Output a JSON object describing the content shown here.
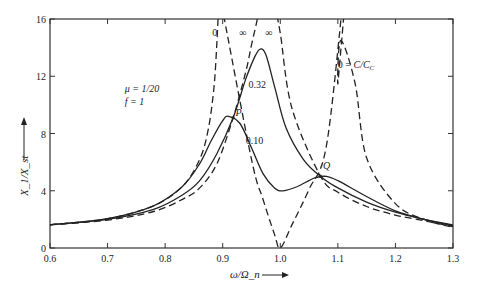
{
  "chart_data": {
    "type": "line",
    "title": "",
    "xlabel": "ω/Ω_n",
    "ylabel": "X_1/X_st",
    "xlim": [
      0.6,
      1.3
    ],
    "ylim": [
      0,
      16
    ],
    "xticks": [
      0.6,
      0.7,
      0.8,
      0.9,
      1.0,
      1.1,
      1.2,
      1.3
    ],
    "xtick_labels": [
      "0.6",
      "0.7",
      "0.8",
      "0.9",
      "1.0",
      "1.1",
      "1.2",
      "1.3"
    ],
    "yticks": [
      0,
      4,
      8,
      12,
      16
    ],
    "ytick_labels": [
      "0",
      "4",
      "8",
      "12",
      "16"
    ],
    "grid": false,
    "legend": null,
    "parameters": {
      "mu": "1/20",
      "f": "1"
    },
    "annotations": [
      {
        "text": "μ = 1/20",
        "x": 0.73,
        "y": 10.9
      },
      {
        "text": "f = 1",
        "x": 0.73,
        "y": 10.0
      },
      {
        "text": "0",
        "x": 0.882,
        "y": 14.8
      },
      {
        "text": "∞",
        "x": 0.935,
        "y": 14.8
      },
      {
        "text": "∞",
        "x": 0.98,
        "y": 14.8
      },
      {
        "text": "0.32",
        "x": 0.945,
        "y": 11.2
      },
      {
        "text": "P",
        "x": 0.922,
        "y": 9.2
      },
      {
        "text": "0.10",
        "x": 0.94,
        "y": 7.3
      },
      {
        "text": "Q",
        "x": 1.074,
        "y": 5.5
      },
      {
        "text": "0 = C/C_C",
        "x": 1.1,
        "y": 12.6
      }
    ],
    "points_of_interest": {
      "P": {
        "x": 0.918,
        "y": 9.1
      },
      "Q": {
        "x": 1.07,
        "y": 5.0
      }
    },
    "series": [
      {
        "name": "C/Cc = 0",
        "style": "dashed",
        "note": "undamped; two resonances near 0.895 and 1.117, zero at 1.0",
        "x": [
          0.6,
          0.7,
          0.78,
          0.83,
          0.86,
          0.875,
          0.885,
          0.89,
          0.95,
          0.97,
          0.99,
          1.0,
          1.02,
          1.05,
          1.08,
          1.1,
          1.105,
          1.13,
          1.15,
          1.2,
          1.25,
          1.3
        ],
        "y": [
          1.62,
          2.05,
          2.95,
          4.3,
          6.2,
          8.3,
          11.3,
          14.5,
          6.2,
          3.4,
          0.95,
          0.0,
          1.6,
          4.1,
          7.1,
          11.5,
          14.5,
          11.5,
          6.3,
          3.1,
          2.0,
          1.45
        ]
      },
      {
        "name": "C/Cc = 0.10",
        "style": "solid",
        "x": [
          0.6,
          0.7,
          0.78,
          0.83,
          0.86,
          0.88,
          0.9,
          0.91,
          0.93,
          0.95,
          0.97,
          0.99,
          1.005,
          1.03,
          1.06,
          1.08,
          1.1,
          1.15,
          1.2,
          1.25,
          1.3
        ],
        "y": [
          1.62,
          2.05,
          2.95,
          4.3,
          5.9,
          7.5,
          8.9,
          9.2,
          8.7,
          7.0,
          5.2,
          4.2,
          4.0,
          4.3,
          4.9,
          5.0,
          4.7,
          3.6,
          2.6,
          2.0,
          1.55
        ]
      },
      {
        "name": "C/Cc = 0.32",
        "style": "solid",
        "x": [
          0.6,
          0.7,
          0.78,
          0.83,
          0.86,
          0.89,
          0.918,
          0.94,
          0.955,
          0.965,
          0.975,
          0.99,
          1.01,
          1.04,
          1.07,
          1.1,
          1.15,
          1.2,
          1.25,
          1.3
        ],
        "y": [
          1.62,
          2.0,
          2.7,
          3.7,
          4.7,
          6.6,
          9.1,
          11.8,
          13.3,
          13.9,
          13.5,
          11.3,
          8.4,
          6.2,
          5.0,
          4.2,
          3.2,
          2.5,
          2.0,
          1.6
        ]
      },
      {
        "name": "C/Cc = ∞",
        "style": "dashed",
        "note": "locked masses; single resonance near 0.976",
        "x": [
          0.6,
          0.7,
          0.78,
          0.83,
          0.86,
          0.89,
          0.918,
          0.94,
          0.95,
          0.96,
          0.965,
          0.99,
          1.0,
          1.02,
          1.07,
          1.1,
          1.15,
          1.2,
          1.25,
          1.3
        ],
        "y": [
          1.62,
          1.95,
          2.55,
          3.4,
          4.2,
          5.9,
          9.1,
          12.3,
          14.2,
          16.0,
          16.0,
          16.0,
          15.0,
          9.8,
          5.0,
          3.9,
          2.9,
          2.3,
          1.9,
          1.5
        ]
      }
    ]
  }
}
